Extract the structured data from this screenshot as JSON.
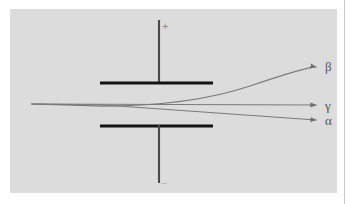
{
  "figure": {
    "background_color": "#ffffff",
    "panel_color": "#dcdcdc",
    "ray_color": "#7a7a7a",
    "plate_color": "#1a1a1a",
    "lead_color": "#4a4a4a"
  },
  "capacitor": {
    "top_plate": {
      "name": "positive-plate",
      "x1": 100,
      "x2": 213,
      "y": 83
    },
    "bottom_plate": {
      "name": "negative-plate",
      "x1": 100,
      "x2": 213,
      "y": 126
    },
    "top_lead": {
      "x": 159,
      "y1": 20,
      "y2": 83
    },
    "bottom_lead": {
      "x": 159,
      "y1": 126,
      "y2": 183
    },
    "positive_terminal_label": "+",
    "negative_terminal_label": "−"
  },
  "source": {
    "name": "beam-origin",
    "x": 32,
    "y": 104
  },
  "rays": [
    {
      "id": "beta",
      "label": "β",
      "label_x": 325,
      "label_y": 60,
      "description": "negatively charged, deflected strongly toward positive plate",
      "path": "M 32 104 L 104 106 Q 190 106 250 86 T 316 67",
      "tip_x": 316,
      "tip_y": 67
    },
    {
      "id": "gamma",
      "label": "γ",
      "label_x": 325,
      "label_y": 99,
      "description": "uncharged, undeflected straight through",
      "path": "M 32 104 L 316 105",
      "tip_x": 316,
      "tip_y": 105
    },
    {
      "id": "alpha",
      "label": "α",
      "label_x": 325,
      "label_y": 114,
      "description": "positively charged, deflected slightly toward negative plate",
      "path": "M 32 104 L 104 105 L 316 120",
      "tip_x": 316,
      "tip_y": 120
    }
  ]
}
